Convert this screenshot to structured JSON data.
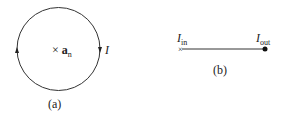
{
  "figure_a": {
    "normal_label": "a",
    "normal_sub": "n",
    "normal_marker": "×",
    "current_label": "I",
    "caption": "(a)"
  },
  "figure_b": {
    "in_label": "I",
    "in_sub": "in",
    "out_label": "I",
    "out_sub": "out",
    "caption": "(b)"
  },
  "colors": {
    "stroke": "#222222"
  }
}
